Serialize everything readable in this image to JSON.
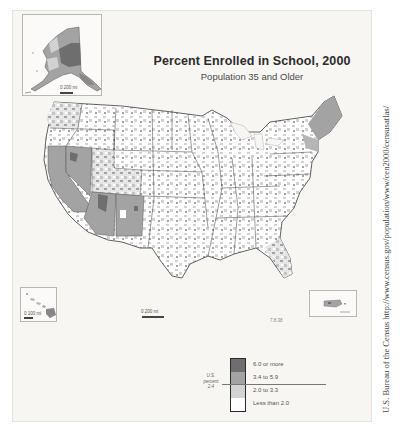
{
  "map": {
    "title": "Percent Enrolled in School, 2000",
    "subtitle": "Population 35 and Older",
    "insets": {
      "alaska": {
        "label": "Alaska",
        "scale": "0   200 mi"
      },
      "hawaii": {
        "label": "Hawaii",
        "scale": "0   100 mi"
      },
      "puerto_rico": {
        "label": "Puerto Rico"
      }
    },
    "main_scale": "0        200 mi",
    "corner_note": "7.8.38",
    "legend": {
      "us_reference": "U.S. percent 2.4",
      "us_reference_lines": [
        "U.S.",
        "percent",
        "2.4"
      ],
      "classes": [
        {
          "label": "6.0 or more",
          "color": "#6e6e6e"
        },
        {
          "label": "3.4 to 5.9",
          "color": "#a3a3a3"
        },
        {
          "label": "2.0 to 3.3",
          "color": "#d2d2d2"
        },
        {
          "label": "Less than 2.0",
          "color": "#ffffff"
        }
      ]
    },
    "colors": {
      "highest": "#6e6e6e",
      "high": "#a3a3a3",
      "mid": "#d2d2d2",
      "low": "#ffffff",
      "water": "#f7f6f3",
      "border": "#3a3a3a"
    }
  },
  "source_credit": "U.S. Bureau of the Census http://www.census.gov/population/www/cen2000/censusatlas/"
}
